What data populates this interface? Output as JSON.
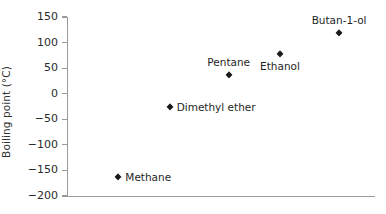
{
  "chart_data": {
    "type": "scatter",
    "title": "",
    "xlabel": "",
    "ylabel": "Boiling point (°C)",
    "ylim": [
      -200,
      150
    ],
    "xlim": [
      0,
      6
    ],
    "grid": false,
    "legend": "none",
    "ytick_labels": [
      "150",
      "100",
      "50",
      "0",
      "−50",
      "−100",
      "−150",
      "−200"
    ],
    "ytick_values": [
      150,
      100,
      50,
      0,
      -50,
      -100,
      -150,
      -200
    ],
    "xtick_labels": [],
    "categories": [
      "Methane",
      "Dimethyl ether",
      "Pentane",
      "Ethanol",
      "Butan-1-ol"
    ],
    "values": [
      -162,
      -25,
      36,
      78,
      118
    ],
    "points": [
      {
        "label": "Methane",
        "value": -162,
        "x": 1.0,
        "label_pos": "right"
      },
      {
        "label": "Dimethyl ether",
        "value": -25,
        "x": 2.0,
        "label_pos": "right"
      },
      {
        "label": "Pentane",
        "value": 36,
        "x": 3.15,
        "label_pos": "above"
      },
      {
        "label": "Ethanol",
        "value": 78,
        "x": 4.15,
        "label_pos": "below"
      },
      {
        "label": "Butan-1-ol",
        "value": 118,
        "x": 5.3,
        "label_pos": "above"
      }
    ]
  },
  "colors": {
    "marker": "#1a1a1a",
    "axis": "#9a9a9a",
    "text": "#1f1f1f",
    "background": "#ffffff"
  }
}
